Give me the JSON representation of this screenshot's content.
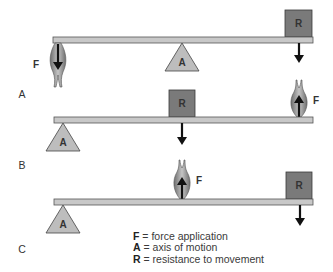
{
  "diagram": {
    "type": "lever-classes",
    "colors": {
      "beam_fill": "#c8c8c8",
      "beam_stroke": "#555555",
      "resistance_fill": "#7a7a7a",
      "resistance_stroke": "#3a3a3a",
      "fulcrum_fill": "#bdbdbd",
      "fulcrum_stroke": "#444444",
      "muscle_fill": "#9a9a9a",
      "arrow": "#111111"
    },
    "panels": [
      {
        "id": "A",
        "label": "A",
        "force_label": "F",
        "axis_label": "A",
        "resistance_label": "R",
        "arrangement": "F - A - R",
        "force_direction": "down",
        "resistance_direction": "down"
      },
      {
        "id": "B",
        "label": "B",
        "force_label": "F",
        "axis_label": "A",
        "resistance_label": "R",
        "arrangement": "A - R - F",
        "force_direction": "up",
        "resistance_direction": "down"
      },
      {
        "id": "C",
        "label": "C",
        "force_label": "F",
        "axis_label": "A",
        "resistance_label": "R",
        "arrangement": "A - F - R",
        "force_direction": "up",
        "resistance_direction": "down"
      }
    ],
    "legend": [
      {
        "key": "F",
        "text": "= force application"
      },
      {
        "key": "A",
        "text": "= axis of motion"
      },
      {
        "key": "R",
        "text": "= resistance to movement"
      }
    ]
  }
}
